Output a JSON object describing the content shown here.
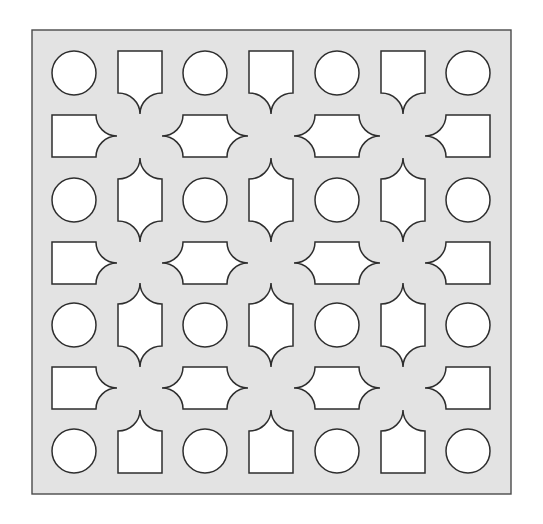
{
  "figure": {
    "canvas": {
      "width": 543,
      "height": 524
    },
    "panel": {
      "x": 32,
      "y": 30,
      "width": 479,
      "height": 464
    },
    "grid": {
      "cols": 7,
      "rows": 7,
      "col_centers": [
        74,
        140,
        205,
        271,
        337,
        403,
        468
      ],
      "row_centers": [
        73,
        136,
        200,
        263,
        325,
        388,
        451
      ]
    },
    "shape_params": {
      "circle_radius": 22,
      "rect_half_w": 22,
      "rect_half_h": 21,
      "cusp_extent": 21
    },
    "colors": {
      "background": "#ffffff",
      "panel_fill": "#e3e3e3",
      "hole_fill": "#ffffff",
      "stroke": "#2e2e2e"
    },
    "legend_of_cells": {
      "even_col_even_row": "circle",
      "odd_col_even_row": "vertical cusped shape",
      "even_col_odd_row": "horizontal cusped shape",
      "odd_col_odd_row": "quatrefoil junction (solid)"
    }
  }
}
